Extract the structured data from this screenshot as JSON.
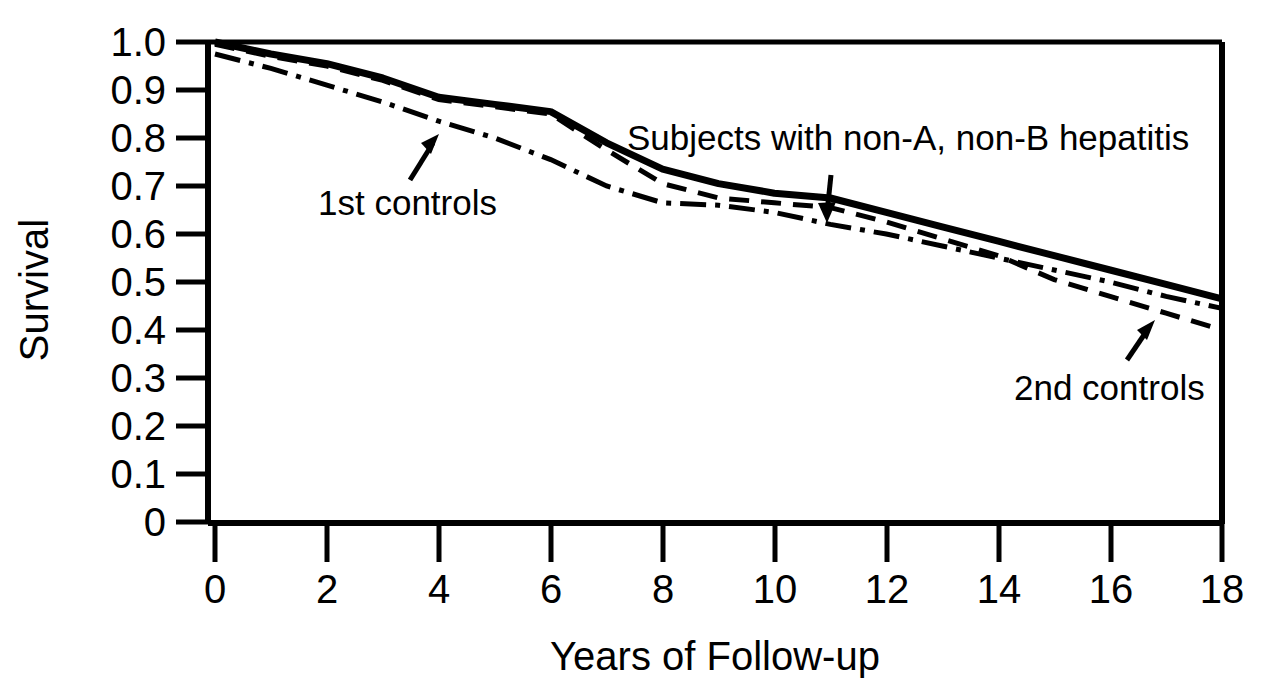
{
  "chart_data": {
    "type": "line",
    "title": "",
    "xlabel": "Years of Follow-up",
    "ylabel": "Survival",
    "xlim": [
      0,
      18
    ],
    "ylim": [
      0,
      1.0
    ],
    "grid": false,
    "legend_position": "inline-annotations",
    "xticks": [
      "0",
      "2",
      "4",
      "6",
      "8",
      "10",
      "12",
      "14",
      "16",
      "18"
    ],
    "xtick_values": [
      0,
      2,
      4,
      6,
      8,
      10,
      12,
      14,
      16,
      18
    ],
    "yticks": [
      "1.0",
      "0.9",
      "0.8",
      "0.7",
      "0.6",
      "0.5",
      "0.4",
      "0.3",
      "0.2",
      "0.1",
      "0"
    ],
    "ytick_values": [
      1.0,
      0.9,
      0.8,
      0.7,
      0.6,
      0.5,
      0.4,
      0.3,
      0.2,
      0.1,
      0
    ],
    "series": [
      {
        "name": "Subjects with non-A, non-B hepatitis",
        "style": "solid",
        "color": "#000000",
        "x": [
          0,
          1,
          2,
          3,
          4,
          5,
          6,
          7,
          8,
          9,
          10,
          11,
          12,
          13,
          14,
          15,
          16,
          17,
          18
        ],
        "values": [
          1.0,
          0.975,
          0.955,
          0.925,
          0.885,
          0.87,
          0.855,
          0.79,
          0.735,
          0.705,
          0.685,
          0.675,
          0.645,
          0.615,
          0.585,
          0.555,
          0.525,
          0.495,
          0.465
        ]
      },
      {
        "name": "2nd controls",
        "style": "dash-dot",
        "color": "#000000",
        "x": [
          0,
          1,
          2,
          3,
          4,
          5,
          6,
          7,
          8,
          9,
          10,
          11,
          12,
          13,
          14,
          15,
          16,
          17,
          18
        ],
        "values": [
          0.995,
          0.97,
          0.95,
          0.92,
          0.88,
          0.865,
          0.85,
          0.775,
          0.705,
          0.675,
          0.665,
          0.655,
          0.625,
          0.59,
          0.555,
          0.505,
          0.47,
          0.435,
          0.4
        ]
      },
      {
        "name": "1st controls",
        "style": "dashed",
        "color": "#000000",
        "x": [
          0,
          1,
          2,
          3,
          4,
          5,
          6,
          7,
          8,
          9,
          10,
          11,
          12,
          13,
          14,
          15,
          16,
          17,
          18
        ],
        "values": [
          0.975,
          0.945,
          0.91,
          0.875,
          0.835,
          0.8,
          0.755,
          0.7,
          0.665,
          0.66,
          0.645,
          0.62,
          0.6,
          0.575,
          0.55,
          0.525,
          0.5,
          0.47,
          0.445
        ]
      }
    ],
    "annotations": [
      {
        "text": "Subjects with non-A, non-B hepatitis",
        "points_to_series": "Subjects with non-A, non-B hepatitis",
        "arrow_direction": "down"
      },
      {
        "text": "1st controls",
        "points_to_series": "1st controls",
        "arrow_direction": "up-right"
      },
      {
        "text": "2nd controls",
        "points_to_series": "2nd controls",
        "arrow_direction": "up-right"
      }
    ]
  },
  "axis": {
    "ylabel": "Survival",
    "xlabel": "Years of Follow-up"
  },
  "annotations": {
    "hepatitis": "Subjects with non-A, non-B hepatitis",
    "first_controls": "1st controls",
    "second_controls": "2nd controls"
  }
}
